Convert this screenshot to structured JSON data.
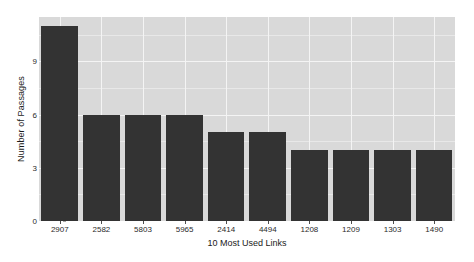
{
  "chart_data": {
    "type": "bar",
    "title": "",
    "xlabel": "10 Most Used Links",
    "ylabel": "Number of Passages",
    "categories": [
      "2907",
      "2582",
      "5803",
      "5965",
      "2414",
      "4494",
      "1208",
      "1209",
      "1303",
      "1490"
    ],
    "values": [
      11,
      6,
      6,
      6,
      5,
      5,
      4,
      4,
      4,
      4
    ],
    "ylim": [
      0,
      11.5
    ],
    "yticks": [
      0,
      3,
      6,
      9
    ],
    "ytick_labels": [
      "0",
      "3",
      "6",
      "9"
    ],
    "grid": true,
    "grid_color": "#f4f4f4",
    "panel_background": "#d9d9d9",
    "bar_color": "#333333",
    "legend": "none",
    "page_background": "#ffffff"
  }
}
